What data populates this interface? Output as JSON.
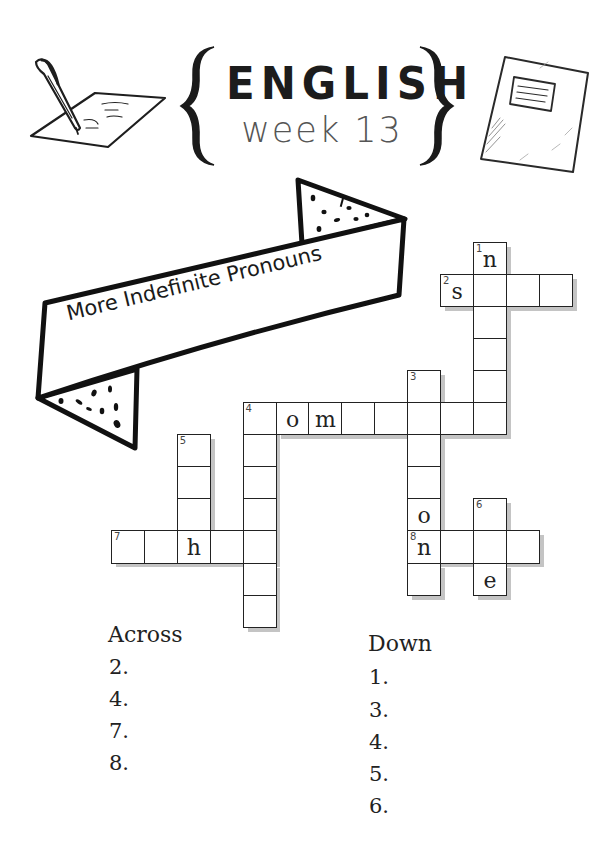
{
  "header": {
    "title": "ENGLISH",
    "subtitle": "week 13",
    "left_icon": "pen-writing-on-paper-icon",
    "right_icon": "notebook-icon"
  },
  "banner": {
    "text": "More Indefinite Pronouns"
  },
  "crossword": {
    "cell_width": 32.9,
    "cell_height": 32.1,
    "origin_x": 111,
    "origin_y": 241.5,
    "cells": [
      {
        "col": 11,
        "row": 0,
        "num": "1",
        "letter": "n"
      },
      {
        "col": 10,
        "row": 1,
        "num": "2",
        "letter": "s"
      },
      {
        "col": 11,
        "row": 1,
        "num": "",
        "letter": ""
      },
      {
        "col": 12,
        "row": 1,
        "num": "",
        "letter": ""
      },
      {
        "col": 13,
        "row": 1,
        "num": "",
        "letter": ""
      },
      {
        "col": 11,
        "row": 2,
        "num": "",
        "letter": ""
      },
      {
        "col": 11,
        "row": 3,
        "num": "",
        "letter": ""
      },
      {
        "col": 9,
        "row": 4,
        "num": "3",
        "letter": ""
      },
      {
        "col": 11,
        "row": 4,
        "num": "",
        "letter": ""
      },
      {
        "col": 4,
        "row": 5,
        "num": "4",
        "letter": ""
      },
      {
        "col": 5,
        "row": 5,
        "num": "",
        "letter": "o"
      },
      {
        "col": 6,
        "row": 5,
        "num": "",
        "letter": "m"
      },
      {
        "col": 7,
        "row": 5,
        "num": "",
        "letter": ""
      },
      {
        "col": 8,
        "row": 5,
        "num": "",
        "letter": ""
      },
      {
        "col": 9,
        "row": 5,
        "num": "",
        "letter": ""
      },
      {
        "col": 10,
        "row": 5,
        "num": "",
        "letter": ""
      },
      {
        "col": 11,
        "row": 5,
        "num": "",
        "letter": ""
      },
      {
        "col": 2,
        "row": 6,
        "num": "5",
        "letter": ""
      },
      {
        "col": 4,
        "row": 6,
        "num": "",
        "letter": ""
      },
      {
        "col": 9,
        "row": 6,
        "num": "",
        "letter": ""
      },
      {
        "col": 2,
        "row": 7,
        "num": "",
        "letter": ""
      },
      {
        "col": 4,
        "row": 7,
        "num": "",
        "letter": ""
      },
      {
        "col": 9,
        "row": 7,
        "num": "",
        "letter": ""
      },
      {
        "col": 2,
        "row": 8,
        "num": "",
        "letter": ""
      },
      {
        "col": 4,
        "row": 8,
        "num": "",
        "letter": ""
      },
      {
        "col": 9,
        "row": 8,
        "num": "",
        "letter": "o"
      },
      {
        "col": 11,
        "row": 8,
        "num": "6",
        "letter": ""
      },
      {
        "col": 0,
        "row": 9,
        "num": "7",
        "letter": ""
      },
      {
        "col": 1,
        "row": 9,
        "num": "",
        "letter": ""
      },
      {
        "col": 2,
        "row": 9,
        "num": "",
        "letter": "h"
      },
      {
        "col": 3,
        "row": 9,
        "num": "",
        "letter": ""
      },
      {
        "col": 4,
        "row": 9,
        "num": "",
        "letter": ""
      },
      {
        "col": 9,
        "row": 9,
        "num": "8",
        "letter": "n"
      },
      {
        "col": 10,
        "row": 9,
        "num": "",
        "letter": ""
      },
      {
        "col": 11,
        "row": 9,
        "num": "",
        "letter": ""
      },
      {
        "col": 12,
        "row": 9,
        "num": "",
        "letter": ""
      },
      {
        "col": 4,
        "row": 10,
        "num": "",
        "letter": ""
      },
      {
        "col": 9,
        "row": 10,
        "num": "",
        "letter": ""
      },
      {
        "col": 11,
        "row": 10,
        "num": "",
        "letter": "e"
      },
      {
        "col": 4,
        "row": 11,
        "num": "",
        "letter": ""
      }
    ]
  },
  "clues": {
    "across": {
      "title": "Across",
      "items": [
        "2.",
        "4.",
        "7.",
        "8."
      ]
    },
    "down": {
      "title": "Down",
      "items": [
        "1.",
        "3.",
        "4.",
        "5.",
        "6."
      ]
    }
  }
}
